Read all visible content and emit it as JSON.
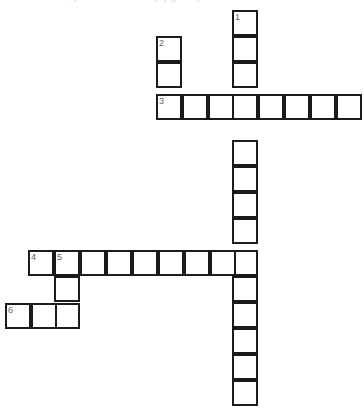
{
  "page": {
    "heading_text": "crossword, please fill in the empty grid squares",
    "background_color": "#ffffff",
    "grid_line_color": "#1b1b1b",
    "cell_fill_color": "#ffffff",
    "number_color": "#5f5f66"
  },
  "grid": {
    "cell_size_px": 26,
    "border_width_px": 2,
    "total_cells": 35,
    "width_px": 364,
    "height_px": 419
  },
  "entries": [
    {
      "number": "1",
      "direction": "down",
      "length": 15,
      "start": {
        "x": 232,
        "y": 10
      }
    },
    {
      "number": "2",
      "direction": "down",
      "length": 2,
      "start": {
        "x": 156,
        "y": 36
      }
    },
    {
      "number": "3",
      "direction": "across",
      "length": 8,
      "start": {
        "x": 156,
        "y": 94
      }
    },
    {
      "number": "4",
      "direction": "across",
      "length": 9,
      "start": {
        "x": 28,
        "y": 250
      }
    },
    {
      "number": "5",
      "direction": "down",
      "length": 3,
      "start": {
        "x": 54,
        "y": 250
      }
    },
    {
      "number": "6",
      "direction": "across",
      "length": 3,
      "start": {
        "x": 5,
        "y": 303
      }
    }
  ],
  "cells": [
    {
      "id": "c-1-1",
      "x": 232,
      "y": 10,
      "number": "1",
      "letter": ""
    },
    {
      "id": "c-1-2",
      "x": 232,
      "y": 36,
      "number": "",
      "letter": ""
    },
    {
      "id": "c-1-3",
      "x": 232,
      "y": 62,
      "number": "",
      "letter": ""
    },
    {
      "id": "c-1-4",
      "x": 232,
      "y": 94,
      "number": "",
      "letter": ""
    },
    {
      "id": "c-1-5",
      "x": 232,
      "y": 140,
      "number": "",
      "letter": ""
    },
    {
      "id": "c-1-6",
      "x": 232,
      "y": 166,
      "number": "",
      "letter": ""
    },
    {
      "id": "c-1-7",
      "x": 232,
      "y": 192,
      "number": "",
      "letter": ""
    },
    {
      "id": "c-1-8",
      "x": 232,
      "y": 218,
      "number": "",
      "letter": ""
    },
    {
      "id": "c-1-9",
      "x": 232,
      "y": 250,
      "number": "",
      "letter": ""
    },
    {
      "id": "c-1-10",
      "x": 232,
      "y": 276,
      "number": "",
      "letter": ""
    },
    {
      "id": "c-1-11",
      "x": 232,
      "y": 302,
      "number": "",
      "letter": ""
    },
    {
      "id": "c-1-12",
      "x": 232,
      "y": 328,
      "number": "",
      "letter": ""
    },
    {
      "id": "c-1-13",
      "x": 232,
      "y": 354,
      "number": "",
      "letter": ""
    },
    {
      "id": "c-1-14",
      "x": 232,
      "y": 380,
      "number": "",
      "letter": ""
    },
    {
      "id": "c-2-1",
      "x": 156,
      "y": 36,
      "number": "2",
      "letter": ""
    },
    {
      "id": "c-2-2",
      "x": 156,
      "y": 62,
      "number": "",
      "letter": ""
    },
    {
      "id": "c-3-1",
      "x": 156,
      "y": 94,
      "number": "3",
      "letter": ""
    },
    {
      "id": "c-3-2",
      "x": 182,
      "y": 94,
      "number": "",
      "letter": ""
    },
    {
      "id": "c-3-3",
      "x": 208,
      "y": 94,
      "number": "",
      "letter": ""
    },
    {
      "id": "c-3-5",
      "x": 258,
      "y": 94,
      "number": "",
      "letter": ""
    },
    {
      "id": "c-3-6",
      "x": 284,
      "y": 94,
      "number": "",
      "letter": ""
    },
    {
      "id": "c-3-7",
      "x": 310,
      "y": 94,
      "number": "",
      "letter": ""
    },
    {
      "id": "c-3-8",
      "x": 336,
      "y": 94,
      "number": "",
      "letter": ""
    },
    {
      "id": "c-4-1",
      "x": 28,
      "y": 250,
      "number": "4",
      "letter": ""
    },
    {
      "id": "c-4-2",
      "x": 54,
      "y": 250,
      "number": "5",
      "letter": ""
    },
    {
      "id": "c-4-3",
      "x": 80,
      "y": 250,
      "number": "",
      "letter": ""
    },
    {
      "id": "c-4-4",
      "x": 106,
      "y": 250,
      "number": "",
      "letter": ""
    },
    {
      "id": "c-4-5",
      "x": 132,
      "y": 250,
      "number": "",
      "letter": ""
    },
    {
      "id": "c-4-6",
      "x": 158,
      "y": 250,
      "number": "",
      "letter": ""
    },
    {
      "id": "c-4-7",
      "x": 184,
      "y": 250,
      "number": "",
      "letter": ""
    },
    {
      "id": "c-4-8",
      "x": 210,
      "y": 250,
      "number": "",
      "letter": ""
    },
    {
      "id": "c-5-2",
      "x": 54,
      "y": 276,
      "number": "",
      "letter": ""
    },
    {
      "id": "c-5-3",
      "x": 54,
      "y": 303,
      "number": "",
      "letter": ""
    },
    {
      "id": "c-6-1",
      "x": 5,
      "y": 303,
      "number": "6",
      "letter": ""
    },
    {
      "id": "c-6-2",
      "x": 31,
      "y": 303,
      "number": "",
      "letter": ""
    }
  ]
}
